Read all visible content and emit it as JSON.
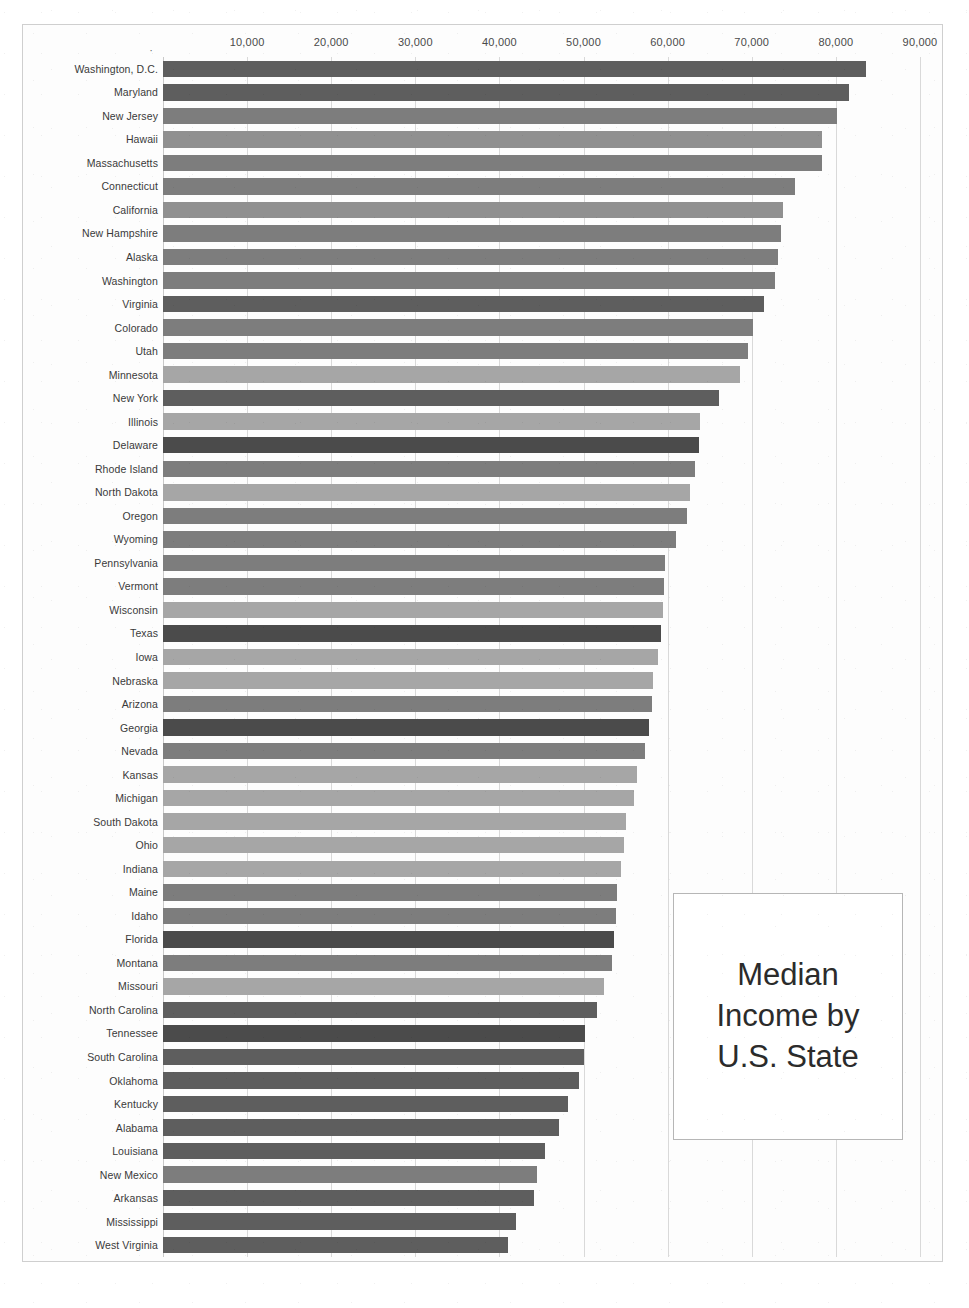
{
  "chart_data": {
    "type": "bar",
    "orientation": "horizontal",
    "title": "Median Income by U.S. State",
    "xlabel": "",
    "ylabel": "",
    "xlim": [
      0,
      90000
    ],
    "grid": true,
    "legend": false,
    "legend_position": "none",
    "x_tick_labels": [
      "10,000",
      "20,000",
      "30,000",
      "40,000",
      "50,000",
      "60,000",
      "70,000",
      "80,000",
      "90,000"
    ],
    "x_ticks": [
      10000,
      20000,
      30000,
      40000,
      50000,
      60000,
      70000,
      80000,
      90000
    ],
    "categories": [
      "Washington, D.C.",
      "Maryland",
      "New Jersey",
      "Hawaii",
      "Massachusetts",
      "Connecticut",
      "California",
      "New Hampshire",
      "Alaska",
      "Washington",
      "Virginia",
      "Colorado",
      "Utah",
      "Minnesota",
      "New York",
      "Illinois",
      "Delaware",
      "Rhode Island",
      "North Dakota",
      "Oregon",
      "Wyoming",
      "Pennsylvania",
      "Vermont",
      "Wisconsin",
      "Texas",
      "Iowa",
      "Nebraska",
      "Arizona",
      "Georgia",
      "Nevada",
      "Kansas",
      "Michigan",
      "South Dakota",
      "Ohio",
      "Indiana",
      "Maine",
      "Idaho",
      "Florida",
      "Montana",
      "Missouri",
      "North Carolina",
      "Tennessee",
      "South Carolina",
      "Oklahoma",
      "Kentucky",
      "Alabama",
      "Louisiana",
      "New Mexico",
      "Arkansas",
      "Mississippi",
      "West Virginia"
    ],
    "values": [
      83600,
      81600,
      80100,
      78400,
      78300,
      75100,
      73700,
      73500,
      73100,
      72800,
      71400,
      70100,
      69600,
      68600,
      66100,
      63800,
      63700,
      63200,
      62600,
      62300,
      61000,
      59700,
      59600,
      59500,
      59200,
      58800,
      58300,
      58100,
      57800,
      57300,
      56300,
      56000,
      55000,
      54800,
      54400,
      54000,
      53800,
      53600,
      53400,
      52400,
      51600,
      50200,
      50100,
      49400,
      48100,
      47100,
      45400,
      44500,
      44100,
      42000,
      41000
    ],
    "bar_shades": [
      "dark",
      "dark",
      "mid",
      "midlight",
      "mid",
      "mid",
      "midlight",
      "mid",
      "mid",
      "mid",
      "dark",
      "mid",
      "mid",
      "light",
      "dark",
      "light",
      "darkest",
      "mid",
      "light",
      "mid",
      "mid",
      "mid",
      "mid",
      "light",
      "darkest",
      "light",
      "light",
      "mid",
      "darkest",
      "mid",
      "light",
      "light",
      "light",
      "light",
      "light",
      "mid",
      "mid",
      "darkest",
      "mid",
      "light",
      "dark",
      "darkest",
      "dark",
      "dark",
      "dark",
      "dark",
      "dark",
      "mid",
      "dark",
      "dark",
      "dark"
    ]
  },
  "colors": {
    "darkest": "#4b4b4b",
    "dark": "#5e5e5e",
    "mid": "#7d7d7d",
    "midlight": "#909090",
    "light": "#a6a6a6",
    "gridline": "#d9d9d9",
    "text": "#3a3a3a",
    "box_border": "#b6b6b6",
    "page_border": "#cfcfcf"
  },
  "axis": {
    "origin_marker": "·"
  }
}
